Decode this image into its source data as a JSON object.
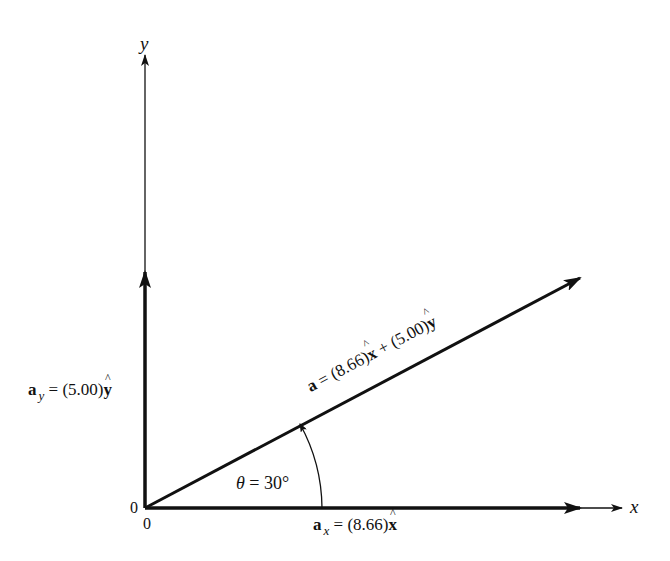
{
  "diagram": {
    "type": "vector-decomposition",
    "axes": {
      "x_label": "x",
      "y_label": "y",
      "origin_labels": [
        "0",
        "0"
      ]
    },
    "vector_a": {
      "symbol": "a",
      "equals": "=",
      "x_coeff": "(8.66)",
      "x_unit": "x",
      "plus": "+",
      "y_coeff": "(5.00)",
      "y_unit": "y"
    },
    "component_x": {
      "symbol": "a",
      "subscript": "x",
      "equals": "=",
      "coeff": "(8.66)",
      "unit": "x"
    },
    "component_y": {
      "symbol": "a",
      "subscript": "y",
      "equals": "=",
      "coeff": "(5.00)",
      "unit": "y"
    },
    "angle": {
      "symbol": "θ",
      "equals": "=",
      "value": "30°"
    },
    "colors": {
      "line": "#111111",
      "background": "#ffffff"
    }
  }
}
